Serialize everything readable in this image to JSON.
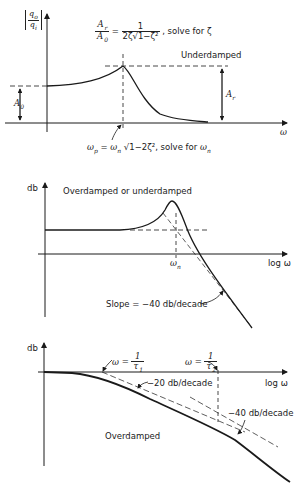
{
  "figures": [
    {
      "id": "underdamped-magnitude",
      "y_axis_label": "|q_o / q_i|",
      "x_axis_label": "ω",
      "formula_ratio": "A_r / A_0 = 1 / (2ζ√(1−ζ²)), solve for ζ",
      "formula_ratio_parts": {
        "lhs_num": "A",
        "lhs_num_sub": "r",
        "lhs_den": "A",
        "lhs_den_sub": "0",
        "rhs_num": "1",
        "rhs_den": "2ζ√1−ζ²",
        "suffix": ", solve for ζ"
      },
      "case_label": "Underdamped",
      "A0_label": "A",
      "A0_sub": "0",
      "Ar_label": "A",
      "Ar_sub": "r",
      "peak_formula": "ω_p = ω_n √(1−2ζ²), solve for ω_n",
      "peak_formula_parts": {
        "wp": "ω",
        "wp_sub": "p",
        "eq": " = ",
        "wn": "ω",
        "wn_sub": "n",
        "root": " √1−2ζ²",
        "suffix": ",  solve for ",
        "target": "ω",
        "target_sub": "n"
      }
    },
    {
      "id": "second-order-bode",
      "y_axis_label": "db",
      "x_axis_label": "log ω",
      "case_label": "Overdamped or underdamped",
      "corner_label": "ω",
      "corner_sub": "n",
      "slope_label": "Slope = −40 db/decade"
    },
    {
      "id": "overdamped-bode",
      "y_axis_label": "db",
      "x_axis_label": "log ω",
      "corner1_label": "ω = ",
      "corner1_num": "1",
      "corner1_den": "τ",
      "corner1_sub": "1",
      "corner2_label": "ω = ",
      "corner2_num": "1",
      "corner2_den": "τ",
      "corner2_sub": "2",
      "slope1_label": "−20 db/decade",
      "slope2_label": "−40 db/decade",
      "case_label": "Overdamped"
    }
  ],
  "colors": {
    "ink": "#1a1a1a",
    "background": "#ffffff"
  }
}
